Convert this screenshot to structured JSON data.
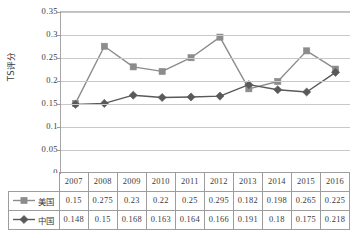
{
  "chart_data": {
    "type": "line",
    "title": "",
    "xlabel": "",
    "ylabel": "TS评分",
    "ylim": [
      0,
      0.35
    ],
    "grid": true,
    "legend_position": "table-left",
    "categories": [
      "2007",
      "2008",
      "2009",
      "2010",
      "2011",
      "2012",
      "2013",
      "2014",
      "2015",
      "2016"
    ],
    "y_ticks": [
      "0",
      "0.05",
      "0.1",
      "0.15",
      "0.2",
      "0.25",
      "0.3",
      "0.35"
    ],
    "y_tick_values": [
      0,
      0.05,
      0.1,
      0.15,
      0.2,
      0.25,
      0.3,
      0.35
    ],
    "series": [
      {
        "name": "美国",
        "marker": "square",
        "color": "#8c8c8c",
        "values": [
          0.15,
          0.275,
          0.23,
          0.22,
          0.25,
          0.295,
          0.182,
          0.198,
          0.265,
          0.225
        ],
        "labels": [
          "0.15",
          "0.275",
          "0.23",
          "0.22",
          "0.25",
          "0.295",
          "0.182",
          "0.198",
          "0.265",
          "0.225"
        ]
      },
      {
        "name": "中国",
        "marker": "diamond",
        "color": "#595959",
        "values": [
          0.148,
          0.15,
          0.168,
          0.163,
          0.164,
          0.166,
          0.191,
          0.18,
          0.175,
          0.218
        ],
        "labels": [
          "0.148",
          "0.15",
          "0.168",
          "0.163",
          "0.164",
          "0.166",
          "0.191",
          "0.18",
          "0.175",
          "0.218"
        ]
      }
    ]
  },
  "colors": {
    "series_usa": "#8c8c8c",
    "series_china": "#595959",
    "gridline": "#c8c8c8",
    "axis": "#a6a6a6",
    "table_border": "#9d9d9d",
    "text": "#3a3a3a",
    "background": "#ffffff"
  }
}
